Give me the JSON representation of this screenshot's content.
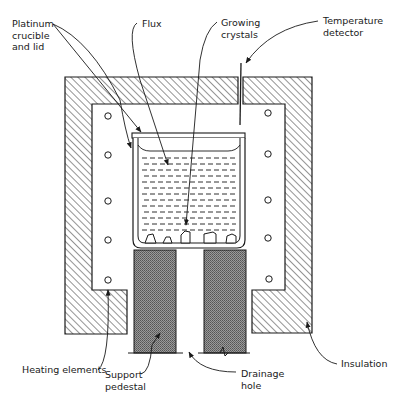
{
  "diagram": {
    "colors": {
      "line": "#1a1a1a",
      "hatch": "#2a2a2a",
      "pedestal": "#8a8a8a",
      "background": "#ffffff"
    },
    "labels": {
      "platinum": "Platinum\ncrucible\nand lid",
      "flux": "Flux",
      "growing_crystals": "Growing\ncrystals",
      "temperature_detector": "Temperature\ndetector",
      "heating_elements": "Heating elements",
      "support_pedestal": "Support\npedestal",
      "drainage_hole": "Drainage\nhole",
      "insulation": "Insulation"
    },
    "components": [
      {
        "name": "insulation",
        "pattern": "diagonal-hatch"
      },
      {
        "name": "platinum-crucible",
        "has_lid": true
      },
      {
        "name": "flux",
        "pattern": "dashed-lines"
      },
      {
        "name": "growing-crystals",
        "count": 5
      },
      {
        "name": "heating-elements",
        "count_left": 5,
        "count_right": 5
      },
      {
        "name": "support-pedestal",
        "pattern": "crosshatch-dark",
        "count": 2
      },
      {
        "name": "drainage-hole"
      },
      {
        "name": "temperature-detector"
      }
    ]
  }
}
